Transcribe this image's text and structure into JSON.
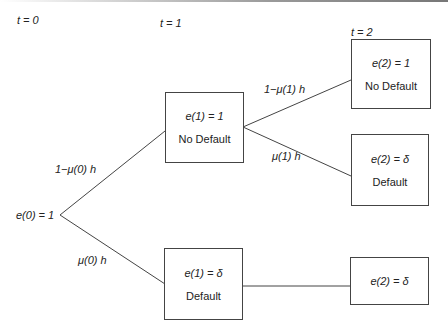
{
  "time_labels": {
    "t0": "t = 0",
    "t1": "t = 1",
    "t2": "t = 2"
  },
  "root": {
    "label": "e(0) = 1"
  },
  "edges": {
    "root_up": "1−μ(0) h",
    "root_down": "μ(0) h",
    "n1_up": "1−μ(1) h",
    "n1_down": "μ(1) h"
  },
  "nodes": {
    "n1_nodefault": {
      "value": "e(1) = 1",
      "status": "No Default"
    },
    "n1_default": {
      "value": "e(1) = δ",
      "status": "Default"
    },
    "n2_nodefault": {
      "value": "e(2) = 1",
      "status": "No Default"
    },
    "n2_default_a": {
      "value": "e(2) = δ",
      "status": "Default"
    },
    "n2_default_b": {
      "value": "e(2) = δ"
    }
  }
}
